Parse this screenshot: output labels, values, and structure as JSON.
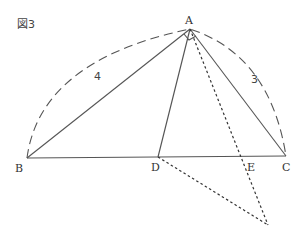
{
  "figure": {
    "label": "図3",
    "points": {
      "A": {
        "label": "A",
        "x": 190,
        "y": 29
      },
      "B": {
        "label": "B",
        "x": 27,
        "y": 158
      },
      "C": {
        "label": "C",
        "x": 286,
        "y": 156
      },
      "D": {
        "label": "D",
        "x": 158,
        "y": 157
      },
      "E": {
        "label": "E",
        "x": 241,
        "y": 157
      },
      "F": {
        "x": 268,
        "y": 225
      }
    },
    "lengths": {
      "AB": "4",
      "AC": "3"
    },
    "right_angle_at": "A"
  }
}
